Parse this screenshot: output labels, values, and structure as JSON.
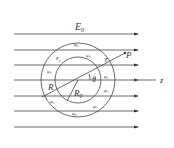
{
  "labels": {
    "field": "E₀",
    "field_main": "E",
    "field_sub": "0",
    "eps": "ε",
    "eps_sub": "r",
    "r": "r",
    "P": "P",
    "theta": "θ",
    "R": "R",
    "R0": "R",
    "R0_sub": "0",
    "z": "z",
    "phi_outer": "φ₂",
    "phi_inner": "φ₁"
  }
}
